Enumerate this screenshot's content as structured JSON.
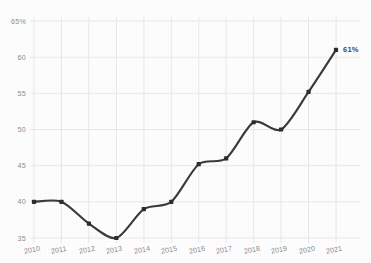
{
  "chart_data": {
    "type": "line",
    "title": "",
    "subtitle": "",
    "xlabel": "",
    "ylabel": "",
    "categories": [
      "2010",
      "2011",
      "2012",
      "2013",
      "2014",
      "2015",
      "2016",
      "2017",
      "2018",
      "2019",
      "2020",
      "2021"
    ],
    "series": [
      {
        "name": "",
        "values": [
          40,
          40,
          37,
          35,
          39,
          40,
          45.2,
          46,
          51,
          50,
          55.2,
          61
        ]
      }
    ],
    "ylim": [
      35,
      65
    ],
    "xlim": [
      "2010",
      "2021"
    ],
    "ytick_labels": [
      "65%",
      "60",
      "55",
      "50",
      "45",
      "40",
      "35"
    ],
    "ytick_values": [
      65,
      60,
      55,
      50,
      45,
      40,
      35
    ],
    "xtick_labels": [
      "2010",
      "2011",
      "2012",
      "2013",
      "2014",
      "2015",
      "2016",
      "2017",
      "2018",
      "2019",
      "2020",
      "2021"
    ],
    "grid": true,
    "grid_axis": "both",
    "legend": false,
    "legend_position": "none",
    "markers": true,
    "smoothing": true,
    "annotations": [
      {
        "text": "61%",
        "x": "2021",
        "y": 61
      }
    ],
    "colors": {
      "line": "#3a3a3a",
      "marker": "#2d2d2d",
      "grid": "#e8e8ea",
      "tick_label": "#8d8d8d",
      "annotation": "#4a4a4a",
      "background": "#fdfdfd"
    }
  }
}
